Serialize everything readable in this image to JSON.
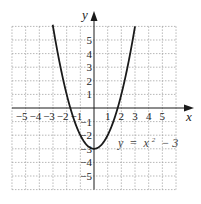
{
  "chart_data": {
    "type": "line",
    "title": "",
    "xlabel": "x",
    "ylabel": "y",
    "xlim": [
      -6,
      6
    ],
    "ylim": [
      -6,
      6
    ],
    "grid": true,
    "grid_style": "dashed",
    "x_ticks": [
      -5,
      -4,
      -3,
      -2,
      -1,
      1,
      2,
      3,
      4,
      5
    ],
    "y_ticks": [
      5,
      4,
      3,
      2,
      1,
      -1,
      -2,
      -3,
      -4,
      -5
    ],
    "x_tick_labels": [
      "−5",
      "−4",
      "−3",
      "−2",
      "−1",
      "1",
      "2",
      "3",
      "4",
      "5"
    ],
    "y_tick_labels": [
      "5",
      "4",
      "3",
      "2",
      "1",
      "−1",
      "−2",
      "−3",
      "−4",
      "−5"
    ],
    "series": [
      {
        "name": "y = x² − 3",
        "function": "x^2 - 3",
        "x": [
          -3,
          -2.5,
          -2,
          -1.5,
          -1,
          -0.5,
          0,
          0.5,
          1,
          1.5,
          2,
          2.5,
          3
        ],
        "y": [
          6,
          3.25,
          1,
          -0.75,
          -2,
          -2.75,
          -3,
          -2.75,
          -2,
          -0.75,
          1,
          3.25,
          6
        ]
      }
    ],
    "annotations": [
      {
        "text": "y = x² − 3",
        "x": 2.8,
        "y": -2.5
      }
    ],
    "legend": null
  },
  "labels": {
    "x_axis": "x",
    "y_axis": "y",
    "equation_y": "y",
    "equation_eq": "=",
    "equation_x": "x",
    "equation_exp": "2",
    "equation_rest": "− 3"
  },
  "colors": {
    "curve": "#1a1a1a",
    "axis": "#1a1a1a",
    "grid": "#9a9a9a"
  }
}
